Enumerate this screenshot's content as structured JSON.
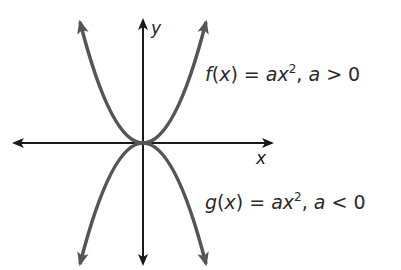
{
  "diagram": {
    "axes": {
      "x_label": "x",
      "y_label": "y",
      "color": "#1a1a1a"
    },
    "curves": [
      {
        "name": "f",
        "label_func": "f",
        "label_var": "x",
        "label_eq_lhs_close": ") =",
        "label_a": "a",
        "label_xsq": "x",
        "label_exp": "2",
        "label_cond_a": "a",
        "label_cond": " > 0",
        "opens": "up",
        "color": "#555555"
      },
      {
        "name": "g",
        "label_func": "g",
        "label_var": "x",
        "label_eq_lhs_close": ") =",
        "label_a": "a",
        "label_xsq": "x",
        "label_exp": "2",
        "label_cond_a": "a",
        "label_cond": " < 0",
        "opens": "down",
        "color": "#555555"
      }
    ]
  }
}
